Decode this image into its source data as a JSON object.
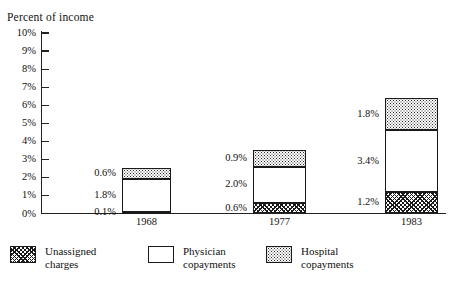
{
  "chart_data": {
    "type": "bar",
    "subtype": "stacked-bar",
    "title": "",
    "xlabel": "",
    "ylabel": "Percent of income",
    "categories": [
      "1968",
      "1977",
      "1983"
    ],
    "ylim": [
      0,
      10
    ],
    "ytick_labels": [
      "10%",
      "9%",
      "8%",
      "7%",
      "6%",
      "5%",
      "4%",
      "3%",
      "2%",
      "1%",
      "0%"
    ],
    "ytick_values": [
      10,
      9,
      8,
      7,
      6,
      5,
      4,
      3,
      2,
      1,
      0
    ],
    "grid": false,
    "legend_position": "bottom",
    "series": [
      {
        "name": "Unassigned charges",
        "pattern": "diagonal-hatch",
        "values": [
          0.1,
          0.6,
          1.2
        ],
        "labels": [
          "0.1%",
          "0.6%",
          "1.2%"
        ]
      },
      {
        "name": "Physician copayments",
        "pattern": "open-white",
        "values": [
          1.8,
          2.0,
          3.4
        ],
        "labels": [
          "1.8%",
          "2.0%",
          "3.4%"
        ]
      },
      {
        "name": "Hospital copayments",
        "pattern": "stipple-dots",
        "values": [
          0.6,
          0.9,
          1.8
        ],
        "labels": [
          "0.6%",
          "0.9%",
          "1.8%"
        ]
      }
    ],
    "totals": [
      2.5,
      3.5,
      6.4
    ]
  },
  "axis": {
    "y_title": "Percent of income"
  },
  "legend": {
    "items": [
      {
        "label": "Unassigned\ncharges",
        "pattern": "diagonal-hatch"
      },
      {
        "label": "Physician\ncopayments",
        "pattern": "open-white"
      },
      {
        "label": "Hospital\ncopayments",
        "pattern": "stipple-dots"
      }
    ]
  },
  "colors": {
    "ink": "#1a1a1a",
    "paper": "#ffffff"
  }
}
